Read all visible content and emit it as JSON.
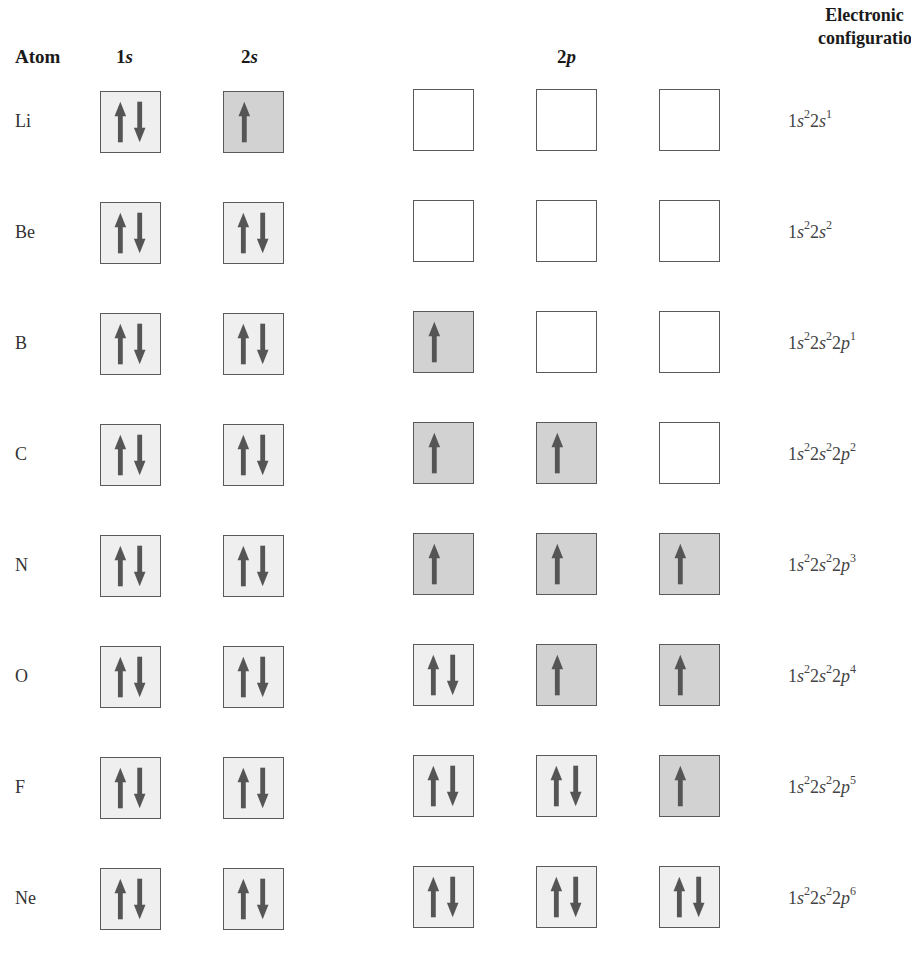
{
  "headers": {
    "atom": "Atom",
    "orbital_1s_num": "1",
    "orbital_1s_letter": "s",
    "orbital_2s_num": "2",
    "orbital_2s_letter": "s",
    "orbital_2p_num": "2",
    "orbital_2p_letter": "p",
    "config_line1": "Electronic",
    "config_line2": "configuration"
  },
  "colors": {
    "paired_box": "#efefef",
    "single_box": "#d2d2d2",
    "empty_box": "#ffffff",
    "arrow": "#555555",
    "border": "#5a5a5a"
  },
  "rows": [
    {
      "atom": "Li",
      "orbitals": [
        "updown",
        "up",
        "empty",
        "empty",
        "empty"
      ],
      "config": [
        {
          "n": "1",
          "l": "s",
          "e": "2"
        },
        {
          "n": "2",
          "l": "s",
          "e": "1"
        }
      ]
    },
    {
      "atom": "Be",
      "orbitals": [
        "updown",
        "updown",
        "empty",
        "empty",
        "empty"
      ],
      "config": [
        {
          "n": "1",
          "l": "s",
          "e": "2"
        },
        {
          "n": "2",
          "l": "s",
          "e": "2"
        }
      ]
    },
    {
      "atom": "B",
      "orbitals": [
        "updown",
        "updown",
        "up",
        "empty",
        "empty"
      ],
      "config": [
        {
          "n": "1",
          "l": "s",
          "e": "2"
        },
        {
          "n": "2",
          "l": "s",
          "e": "2"
        },
        {
          "n": "2",
          "l": "p",
          "e": "1"
        }
      ]
    },
    {
      "atom": "C",
      "orbitals": [
        "updown",
        "updown",
        "up",
        "up",
        "empty"
      ],
      "config": [
        {
          "n": "1",
          "l": "s",
          "e": "2"
        },
        {
          "n": "2",
          "l": "s",
          "e": "2"
        },
        {
          "n": "2",
          "l": "p",
          "e": "2"
        }
      ]
    },
    {
      "atom": "N",
      "orbitals": [
        "updown",
        "updown",
        "up",
        "up",
        "up"
      ],
      "config": [
        {
          "n": "1",
          "l": "s",
          "e": "2"
        },
        {
          "n": "2",
          "l": "s",
          "e": "2"
        },
        {
          "n": "2",
          "l": "p",
          "e": "3"
        }
      ]
    },
    {
      "atom": "O",
      "orbitals": [
        "updown",
        "updown",
        "updown",
        "up",
        "up"
      ],
      "config": [
        {
          "n": "1",
          "l": "s",
          "e": "2"
        },
        {
          "n": "2",
          "l": "s",
          "e": "2"
        },
        {
          "n": "2",
          "l": "p",
          "e": "4"
        }
      ]
    },
    {
      "atom": "F",
      "orbitals": [
        "updown",
        "updown",
        "updown",
        "updown",
        "up"
      ],
      "config": [
        {
          "n": "1",
          "l": "s",
          "e": "2"
        },
        {
          "n": "2",
          "l": "s",
          "e": "2"
        },
        {
          "n": "2",
          "l": "p",
          "e": "5"
        }
      ]
    },
    {
      "atom": "Ne",
      "orbitals": [
        "updown",
        "updown",
        "updown",
        "updown",
        "updown"
      ],
      "config": [
        {
          "n": "1",
          "l": "s",
          "e": "2"
        },
        {
          "n": "2",
          "l": "s",
          "e": "2"
        },
        {
          "n": "2",
          "l": "p",
          "e": "6"
        }
      ]
    }
  ]
}
